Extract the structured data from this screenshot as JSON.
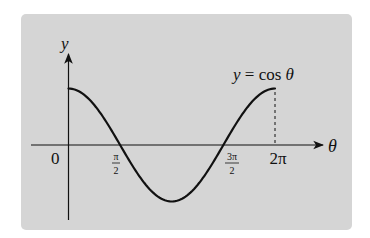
{
  "chart_data": {
    "type": "line",
    "title": "",
    "xlabel": "θ",
    "ylabel": "y",
    "function": "y = cos θ",
    "annotation": "y = cos θ",
    "x_ticks": [
      {
        "value": 0,
        "label": "0"
      },
      {
        "value": 1.5708,
        "label": "π/2",
        "num": "π",
        "den": "2"
      },
      {
        "value": 4.7124,
        "label": "3π/2",
        "num": "3π",
        "den": "2"
      },
      {
        "value": 6.2832,
        "label": "2π"
      }
    ],
    "xlim": [
      0,
      6.2832
    ],
    "ylim": [
      -1,
      1
    ],
    "x": [
      0,
      0.7854,
      1.5708,
      2.3562,
      3.1416,
      3.927,
      4.7124,
      5.4978,
      6.2832
    ],
    "values": [
      1,
      0.7071,
      0,
      -0.7071,
      -1,
      -0.7071,
      0,
      0.7071,
      1
    ],
    "grid": false,
    "dashed_guide": {
      "x": 6.2832,
      "from_y": 0,
      "to_y": 1
    }
  },
  "colors": {
    "panel": "#d5d5d5",
    "ink": "#111111"
  }
}
